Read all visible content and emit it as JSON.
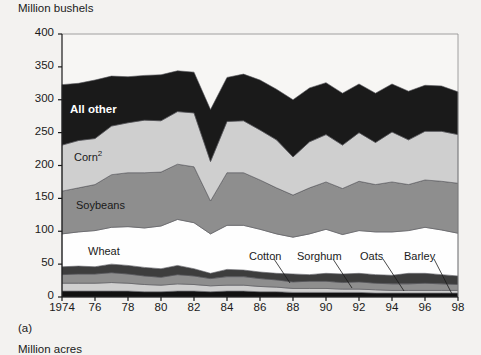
{
  "figure": {
    "caption": "(a)",
    "y_axis_title": "Million bushels",
    "below_figure_title": "Million acres"
  },
  "chart_data": {
    "type": "area",
    "stacked": true,
    "title": "",
    "xlabel": "",
    "ylabel": "Million bushels",
    "ylim": [
      0,
      400
    ],
    "ytick_labels": [
      "0",
      "50",
      "100",
      "150",
      "200",
      "250",
      "300",
      "350",
      "400"
    ],
    "ytick_values": [
      0,
      50,
      100,
      150,
      200,
      250,
      300,
      350,
      400
    ],
    "grid": false,
    "legend_position": "inline-annotations",
    "x": [
      1974,
      1975,
      1976,
      1977,
      1978,
      1979,
      1980,
      1981,
      1982,
      1983,
      1984,
      1985,
      1986,
      1987,
      1988,
      1989,
      1990,
      1991,
      1992,
      1993,
      1994,
      1995,
      1996,
      1997,
      1998
    ],
    "xtick_labels": [
      "1974",
      "76",
      "78",
      "80",
      "82",
      "84",
      "86",
      "88",
      "90",
      "92",
      "94",
      "96",
      "98"
    ],
    "xtick_values": [
      1974,
      1976,
      1978,
      1980,
      1982,
      1984,
      1986,
      1988,
      1990,
      1992,
      1994,
      1996,
      1998
    ],
    "series": [
      {
        "name": "Barley",
        "color": "#111111",
        "values": [
          9,
          9,
          9,
          9,
          9,
          8,
          8,
          9,
          9,
          8,
          9,
          9,
          8,
          8,
          7,
          7,
          7,
          7,
          7,
          6,
          6,
          6,
          6,
          6,
          6
        ]
      },
      {
        "name": "Oats",
        "color": "#cfcfcf",
        "values": [
          12,
          12,
          12,
          13,
          12,
          11,
          10,
          11,
          10,
          9,
          9,
          9,
          8,
          7,
          6,
          6,
          6,
          5,
          5,
          5,
          4,
          4,
          4,
          4,
          4
        ]
      },
      {
        "name": "Sorghum",
        "color": "#8e8e8e",
        "values": [
          13,
          14,
          14,
          15,
          14,
          13,
          12,
          14,
          13,
          11,
          13,
          13,
          12,
          11,
          10,
          11,
          11,
          10,
          11,
          10,
          10,
          10,
          11,
          10,
          9
        ]
      },
      {
        "name": "Cotton",
        "color": "#3d3d3d",
        "values": [
          12,
          12,
          11,
          13,
          13,
          13,
          13,
          14,
          11,
          8,
          11,
          10,
          10,
          10,
          12,
          10,
          12,
          13,
          13,
          13,
          13,
          16,
          15,
          14,
          13
        ]
      },
      {
        "name": "Wheat",
        "color": "#fefefe",
        "values": [
          50,
          52,
          55,
          56,
          59,
          60,
          65,
          70,
          70,
          60,
          67,
          68,
          65,
          60,
          56,
          62,
          67,
          60,
          65,
          65,
          66,
          65,
          70,
          68,
          65
        ]
      },
      {
        "name": "Soybeans",
        "color": "#8e8e8e",
        "values": [
          65,
          67,
          70,
          80,
          82,
          84,
          82,
          84,
          85,
          50,
          80,
          80,
          75,
          70,
          64,
          70,
          72,
          70,
          75,
          72,
          76,
          70,
          72,
          74,
          76
        ]
      },
      {
        "name": "Corn",
        "color": "#cfcfcf",
        "values": [
          70,
          72,
          70,
          74,
          76,
          80,
          78,
          80,
          82,
          60,
          78,
          79,
          76,
          73,
          58,
          70,
          72,
          66,
          74,
          64,
          76,
          68,
          74,
          76,
          74
        ]
      },
      {
        "name": "All other",
        "color": "#1a1a1a"
      }
    ],
    "series_labels": [
      {
        "name": "All other",
        "text": "All other"
      },
      {
        "name": "Corn",
        "text": "Corn",
        "superscript": "2"
      },
      {
        "name": "Soybeans",
        "text": "Soybeans"
      },
      {
        "name": "Wheat",
        "text": "Wheat"
      },
      {
        "name": "Cotton",
        "text": "Cotton"
      },
      {
        "name": "Sorghum",
        "text": "Sorghum"
      },
      {
        "name": "Oats",
        "text": "Oats"
      },
      {
        "name": "Barley",
        "text": "Barley"
      }
    ],
    "totals": [
      323,
      325,
      330,
      336,
      335,
      337,
      338,
      344,
      342,
      285,
      334,
      339,
      330,
      316,
      300,
      318,
      326,
      310,
      324,
      310,
      324,
      313,
      322,
      321,
      312
    ]
  },
  "colors": {
    "all_other": "#1a1a1a",
    "corn": "#cfcfcf",
    "soybeans": "#8e8e8e",
    "wheat": "#fefefe",
    "cotton": "#3d3d3d",
    "sorghum": "#8e8e8e",
    "oats": "#cfcfcf",
    "barley": "#111111",
    "page_background": "#f3f2f0",
    "axis": "#8a8a8a"
  }
}
